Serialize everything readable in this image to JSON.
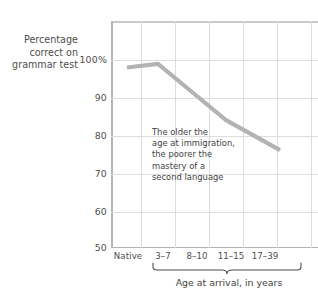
{
  "chart_data": {
    "type": "line",
    "title": "",
    "xlabel": "Age at arrival, in years",
    "ylabel": "Percentage correct on grammar test",
    "ylabel_lines": [
      "Percentage",
      "correct on",
      "grammar test"
    ],
    "categories": [
      "Native",
      "3–7",
      "8–10",
      "11–15",
      "17–39"
    ],
    "values": [
      98,
      99,
      91.5,
      84,
      76
    ],
    "series": [
      {
        "name": "Percentage correct on grammar test",
        "values": [
          98,
          99,
          91.5,
          84,
          76
        ]
      }
    ],
    "ylim": [
      50,
      100
    ],
    "yticks": [
      100,
      90,
      80,
      70,
      60,
      50
    ],
    "ytick_labels": [
      "100%",
      "90",
      "80",
      "70",
      "60",
      "50"
    ],
    "grid": true,
    "legend": "none",
    "line_color": "#b3b3b3",
    "grid_color": "#dddddd",
    "axis_color": "#b4b4b4",
    "text_color": "#4d4d4d",
    "annotation": {
      "lines": [
        "The older the",
        "age at immigration,",
        "the poorer the",
        "mastery of a",
        "second language"
      ]
    },
    "brace": {
      "label": "Age at arrival, in years",
      "spans": [
        "3–7",
        "8–10",
        "11–15",
        "17–39"
      ]
    }
  }
}
